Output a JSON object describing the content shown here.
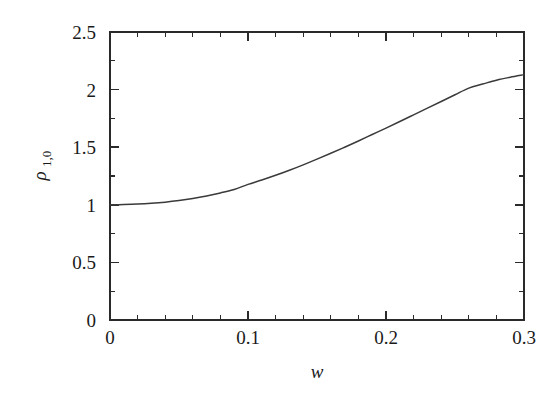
{
  "figure": {
    "background_color": "#ffffff",
    "axis_color": "#2a2a2a",
    "curve_color": "#3a3a3a",
    "xlabel": "w",
    "ylabel_base": "ρ",
    "ylabel_subscript": "1,0"
  },
  "chart_data": {
    "type": "line",
    "title": "",
    "xlabel": "w",
    "ylabel": "ρ_{1,0}",
    "xlim": [
      0,
      0.3
    ],
    "ylim": [
      0,
      2.5
    ],
    "grid": false,
    "legend": "none",
    "x_major_ticks": [
      0,
      0.1,
      0.2,
      0.3
    ],
    "x_major_tick_labels": [
      "0",
      "0.1",
      "0.2",
      "0.3"
    ],
    "x_minor_tick_step": 0.02,
    "y_major_ticks": [
      0,
      0.5,
      1,
      1.5,
      2,
      2.5
    ],
    "y_major_tick_labels": [
      "0",
      "0.5",
      "1",
      "1.5",
      "2",
      "2.5"
    ],
    "y_minor_tick_step": 0.25,
    "series": [
      {
        "name": "rho_1_0",
        "x": [
          0.0,
          0.01,
          0.02,
          0.03,
          0.04,
          0.05,
          0.06,
          0.07,
          0.08,
          0.09,
          0.1,
          0.11,
          0.12,
          0.13,
          0.14,
          0.15,
          0.16,
          0.17,
          0.18,
          0.19,
          0.2,
          0.21,
          0.22,
          0.23,
          0.24,
          0.25,
          0.26,
          0.27,
          0.28,
          0.29,
          0.3
        ],
        "values": [
          1.0,
          1.002,
          1.006,
          1.013,
          1.023,
          1.037,
          1.055,
          1.077,
          1.103,
          1.133,
          1.177,
          1.215,
          1.256,
          1.3,
          1.347,
          1.396,
          1.447,
          1.5,
          1.554,
          1.61,
          1.666,
          1.723,
          1.781,
          1.839,
          1.897,
          1.955,
          2.013,
          2.048,
          2.082,
          2.108,
          2.13
        ]
      }
    ]
  }
}
